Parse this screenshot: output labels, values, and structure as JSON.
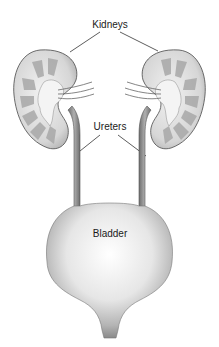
{
  "figure": {
    "labels": {
      "kidneys": "Kidneys",
      "ureters": "Ureters",
      "bladder": "Bladder"
    },
    "structures": [
      "left-kidney",
      "right-kidney",
      "left-ureter",
      "right-ureter",
      "bladder",
      "urethra"
    ],
    "colors": {
      "outline": "#4a4a4a",
      "kidney_cortex": "#d9d9d9",
      "kidney_pyramid": "#a8a8a8",
      "pelvis": "#f4f4f4",
      "ureter": "#8c8c8c",
      "bladder_light": "#fafafa",
      "bladder_dark": "#9a9a9a",
      "leader_line": "#333333"
    }
  }
}
